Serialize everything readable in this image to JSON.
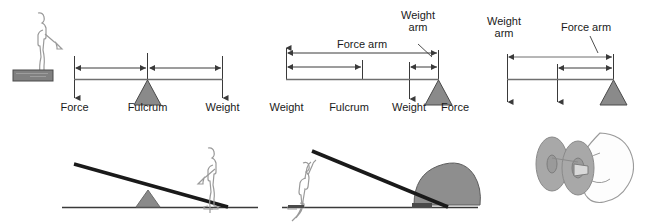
{
  "figure": {
    "colors": {
      "stroke": "#1a1a1a",
      "line_gray": "#6f6f6f",
      "fulcrum_fill": "#8a8a8a",
      "block_fill": "#808080",
      "outline_light": "#9a9a9a",
      "rock_fill": "#8e8e8e",
      "wheel_fill": "#a8a8a8",
      "background": "#ffffff"
    }
  },
  "diagrams": [
    {
      "id": "first-class-lever",
      "labels": {
        "force": "Force",
        "fulcrum": "Fulcrum",
        "weight": "Weight"
      },
      "arrow_labels": [],
      "icons": [
        "person-icon",
        "block-icon",
        "fulcrum-triangle-icon",
        "down-arrow-icon",
        "dimension-arrow-icon"
      ]
    },
    {
      "id": "second-class-lever",
      "labels": {
        "weight_left": "Weight",
        "fulcrum": "Fulcrum",
        "weight_right": "Weight",
        "force": "Force"
      },
      "arrow_labels": {
        "force_arm": "Force arm",
        "weight_arm_line1": "Weight",
        "weight_arm_line2": "arm"
      },
      "icons": [
        "fulcrum-triangle-icon",
        "down-arrow-icon",
        "up-arrow-icon",
        "dimension-arrow-icon"
      ]
    },
    {
      "id": "third-class-lever",
      "labels": {},
      "arrow_labels": {
        "weight_arm_line1": "Weight",
        "weight_arm_line2": "arm",
        "force_arm": "Force arm"
      },
      "icons": [
        "fulcrum-triangle-icon",
        "down-arrow-icon",
        "dimension-arrow-icon"
      ]
    }
  ],
  "illustrations": [
    {
      "id": "seesaw-illustration",
      "caption": "",
      "icons": [
        "person-standing-icon",
        "plank-icon",
        "fulcrum-triangle-icon",
        "ground-line-icon"
      ]
    },
    {
      "id": "lifting-rock-illustration",
      "caption": "",
      "icons": [
        "person-pushing-icon",
        "lever-bar-icon",
        "rock-icon",
        "ground-line-icon"
      ]
    },
    {
      "id": "wheel-axle-illustration",
      "caption": "",
      "icons": [
        "wheel-icon",
        "axle-icon",
        "hand-icon"
      ]
    }
  ]
}
